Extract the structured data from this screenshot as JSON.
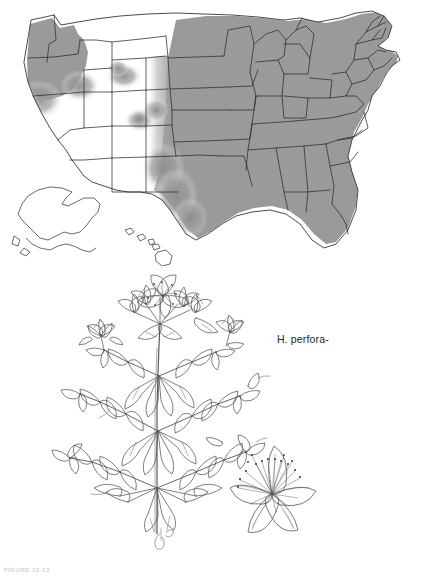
{
  "figure": {
    "kind": "botanical-plate",
    "caption_partial": "FIGURE 12-13"
  },
  "map": {
    "name": "us-distribution-map",
    "title": "",
    "colors": {
      "shaded_fill": "#9a9a9a",
      "unshaded_fill": "#ffffff",
      "border_stroke": "#2b2b2b",
      "background": "#ffffff"
    },
    "legend": {
      "shaded_meaning": "present",
      "unshaded_meaning": "absent"
    },
    "shaded_states": [
      "Washington",
      "Oregon",
      "Idaho",
      "Montana",
      "North Dakota",
      "South Dakota",
      "Nebraska",
      "Kansas",
      "Oklahoma",
      "Texas",
      "Minnesota",
      "Iowa",
      "Missouri",
      "Arkansas",
      "Louisiana",
      "Wisconsin",
      "Illinois",
      "Michigan",
      "Indiana",
      "Ohio",
      "Kentucky",
      "Tennessee",
      "Mississippi",
      "Alabama",
      "Georgia",
      "Florida",
      "South Carolina",
      "North Carolina",
      "Virginia",
      "West Virginia",
      "Maryland",
      "Delaware",
      "Pennsylvania",
      "New Jersey",
      "New York",
      "Connecticut",
      "Rhode Island",
      "Massachusetts",
      "Vermont",
      "New Hampshire",
      "Maine"
    ],
    "unshaded_states": [
      "California",
      "Nevada",
      "Utah",
      "Arizona",
      "New Mexico",
      "Colorado",
      "Wyoming",
      "Alaska",
      "Hawaii"
    ],
    "partially_shaded_states": [
      "California",
      "Idaho",
      "Montana",
      "Colorado",
      "Wyoming",
      "Texas",
      "Oklahoma"
    ],
    "insets": [
      "Alaska",
      "Hawaii"
    ]
  },
  "illustration": {
    "name": "plant-line-drawing",
    "species_label": "H. perfora-",
    "subject": "Hypericum perforatum",
    "common_name": "St. John's Wort",
    "parts": [
      "flowering-stem",
      "opposite-leaves",
      "terminal-cyme",
      "flower-detail"
    ],
    "flower_detail": {
      "petal_count": 5,
      "has_stamens": true
    },
    "signature": "artist-monogram",
    "colors": {
      "ink": "#4a4a4a",
      "ink_light": "#8a8a8a",
      "paper": "#ffffff"
    }
  }
}
